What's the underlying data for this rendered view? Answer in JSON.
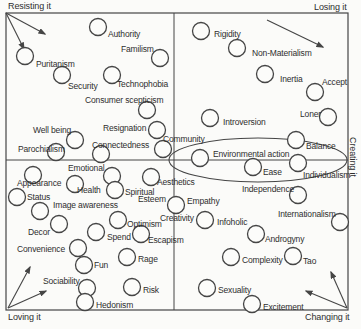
{
  "diagram": {
    "type": "quadrant-perceptual-map",
    "background": "#fbfbf9",
    "line_color": "#454545",
    "text_color": "#2e2e2e",
    "bubble_fill": "#fcfcfa",
    "bubble_radius": 8.5,
    "frame": {
      "x": 6,
      "y": 13,
      "w": 342,
      "h": 297
    },
    "axes": {
      "vertical_x": 174,
      "horizontal_y": 160
    },
    "highlight_ellipse": {
      "cx": 258,
      "cy": 160,
      "rx": 89,
      "ry": 22
    },
    "corner_labels": [
      {
        "id": "top-left",
        "text": "Resisting it",
        "x": 8,
        "y": 1
      },
      {
        "id": "top-right",
        "text": "Losing it",
        "x": 314,
        "y": 2
      },
      {
        "id": "bottom-left",
        "text": "Loving it",
        "x": 8,
        "y": 312
      },
      {
        "id": "bottom-right",
        "text": "Changing it",
        "x": 305,
        "y": 312
      },
      {
        "id": "right",
        "text": "Creating it",
        "x": 358,
        "y": 137,
        "rotation": 90
      }
    ],
    "arrows": [
      {
        "x1": 6,
        "y1": 13,
        "x2": 45,
        "y2": 34
      },
      {
        "x1": 6,
        "y1": 13,
        "x2": 24,
        "y2": 49
      },
      {
        "x1": 267,
        "y1": 20,
        "x2": 323,
        "y2": 47
      },
      {
        "x1": 8,
        "y1": 308,
        "x2": 30,
        "y2": 267
      },
      {
        "x1": 8,
        "y1": 308,
        "x2": 46,
        "y2": 291
      },
      {
        "x1": 347,
        "y1": 308,
        "x2": 331,
        "y2": 272
      },
      {
        "x1": 347,
        "y1": 308,
        "x2": 306,
        "y2": 291
      }
    ],
    "bubbles": [
      {
        "x": 25,
        "y": 56
      },
      {
        "x": 98,
        "y": 27
      },
      {
        "x": 160,
        "y": 58
      },
      {
        "x": 62,
        "y": 75
      },
      {
        "x": 112,
        "y": 75
      },
      {
        "x": 147,
        "y": 110
      },
      {
        "x": 75,
        "y": 140
      },
      {
        "x": 157,
        "y": 130
      },
      {
        "x": 101,
        "y": 154
      },
      {
        "x": 56,
        "y": 152
      },
      {
        "x": 163,
        "y": 149
      },
      {
        "x": 201,
        "y": 31
      },
      {
        "x": 237,
        "y": 48
      },
      {
        "x": 265,
        "y": 74
      },
      {
        "x": 315,
        "y": 92
      },
      {
        "x": 328,
        "y": 117
      },
      {
        "x": 210,
        "y": 118
      },
      {
        "x": 296,
        "y": 140
      },
      {
        "x": 200,
        "y": 158
      },
      {
        "x": 253,
        "y": 167
      },
      {
        "x": 298,
        "y": 163
      },
      {
        "x": 298,
        "y": 195
      },
      {
        "x": 340,
        "y": 222
      },
      {
        "x": 33,
        "y": 175
      },
      {
        "x": 75,
        "y": 184
      },
      {
        "x": 112,
        "y": 176
      },
      {
        "x": 115,
        "y": 190
      },
      {
        "x": 151,
        "y": 177
      },
      {
        "x": 17,
        "y": 197
      },
      {
        "x": 176,
        "y": 205
      },
      {
        "x": 40,
        "y": 211
      },
      {
        "x": 118,
        "y": 220
      },
      {
        "x": 59,
        "y": 224
      },
      {
        "x": 96,
        "y": 232
      },
      {
        "x": 141,
        "y": 234
      },
      {
        "x": 205,
        "y": 220
      },
      {
        "x": 256,
        "y": 234
      },
      {
        "x": 78,
        "y": 248
      },
      {
        "x": 84,
        "y": 265
      },
      {
        "x": 127,
        "y": 257
      },
      {
        "x": 231,
        "y": 257
      },
      {
        "x": 293,
        "y": 256
      },
      {
        "x": 87,
        "y": 288
      },
      {
        "x": 132,
        "y": 287
      },
      {
        "x": 207,
        "y": 288
      },
      {
        "x": 85,
        "y": 302
      },
      {
        "x": 252,
        "y": 304
      }
    ],
    "labels": [
      {
        "text": "Authority",
        "x": 108,
        "y": 29
      },
      {
        "text": "Familism",
        "x": 121,
        "y": 44
      },
      {
        "text": "Puritanism",
        "x": 36,
        "y": 59
      },
      {
        "text": "Security",
        "x": 68,
        "y": 81
      },
      {
        "text": "Technophobia",
        "x": 117,
        "y": 79
      },
      {
        "text": "Consumer scepticism",
        "x": 85,
        "y": 95
      },
      {
        "text": "Well being",
        "x": 33,
        "y": 125
      },
      {
        "text": "Resignation",
        "x": 103,
        "y": 123
      },
      {
        "text": "Connectedness",
        "x": 92,
        "y": 140
      },
      {
        "text": "Parochialism",
        "x": 18,
        "y": 144
      },
      {
        "text": "Community",
        "x": 163,
        "y": 134
      },
      {
        "text": "Emotional",
        "x": 68,
        "y": 163
      },
      {
        "text": "Rigidity",
        "x": 214,
        "y": 29
      },
      {
        "text": "Non-Materialism",
        "x": 252,
        "y": 48
      },
      {
        "text": "Inertia",
        "x": 280,
        "y": 74
      },
      {
        "text": "Accept",
        "x": 322,
        "y": 77
      },
      {
        "text": "Loner",
        "x": 300,
        "y": 109
      },
      {
        "text": "Introversion",
        "x": 223,
        "y": 117
      },
      {
        "text": "Balance",
        "x": 306,
        "y": 141
      },
      {
        "text": "Environmental action",
        "x": 213,
        "y": 149
      },
      {
        "text": "Ease",
        "x": 263,
        "y": 167
      },
      {
        "text": "Individualism",
        "x": 303,
        "y": 170
      },
      {
        "text": "Independence",
        "x": 242,
        "y": 184
      },
      {
        "text": "Internationalism",
        "x": 278,
        "y": 209
      },
      {
        "text": "Appearance",
        "x": 17,
        "y": 178
      },
      {
        "text": "Health",
        "x": 77,
        "y": 185
      },
      {
        "text": "Spiritual",
        "x": 125,
        "y": 187
      },
      {
        "text": "Aesthetics",
        "x": 157,
        "y": 177
      },
      {
        "text": "Status",
        "x": 27,
        "y": 192
      },
      {
        "text": "Esteem",
        "x": 138,
        "y": 194
      },
      {
        "text": "Empathy",
        "x": 187,
        "y": 196
      },
      {
        "text": "Image awareness",
        "x": 53,
        "y": 200
      },
      {
        "text": "Creativity",
        "x": 160,
        "y": 213
      },
      {
        "text": "Infoholic",
        "x": 217,
        "y": 217
      },
      {
        "text": "Optimism",
        "x": 127,
        "y": 219
      },
      {
        "text": "Decor",
        "x": 28,
        "y": 227
      },
      {
        "text": "Spend",
        "x": 107,
        "y": 232
      },
      {
        "text": "Escapism",
        "x": 148,
        "y": 235
      },
      {
        "text": "Convenience",
        "x": 17,
        "y": 244
      },
      {
        "text": "Androgyny",
        "x": 265,
        "y": 234
      },
      {
        "text": "Fun",
        "x": 94,
        "y": 260
      },
      {
        "text": "Rage",
        "x": 138,
        "y": 254
      },
      {
        "text": "Complexity",
        "x": 242,
        "y": 255
      },
      {
        "text": "Tao",
        "x": 303,
        "y": 256
      },
      {
        "text": "Sociability",
        "x": 43,
        "y": 276
      },
      {
        "text": "Risk",
        "x": 143,
        "y": 285
      },
      {
        "text": "Sexuality",
        "x": 218,
        "y": 285
      },
      {
        "text": "Hedonism",
        "x": 96,
        "y": 300
      },
      {
        "text": "Excitement",
        "x": 263,
        "y": 302
      }
    ]
  }
}
